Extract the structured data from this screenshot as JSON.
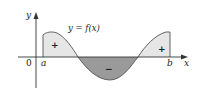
{
  "diagram": {
    "function_label": "y = f(x)",
    "axes": {
      "x_label": "x",
      "y_label": "y",
      "origin_label": "0"
    },
    "bounds": {
      "a_label": "a",
      "b_label": "b"
    },
    "regions": [
      {
        "sign": "+",
        "position": "left",
        "fill": "#e6e6e6"
      },
      {
        "sign": "−",
        "position": "middle",
        "fill": "#9a9a9a"
      },
      {
        "sign": "+",
        "position": "right",
        "fill": "#e6e6e6"
      }
    ],
    "colors": {
      "positive_fill": "#e6e6e6",
      "negative_fill": "#9a9a9a",
      "curve": "#555555",
      "axis": "#333333"
    }
  }
}
